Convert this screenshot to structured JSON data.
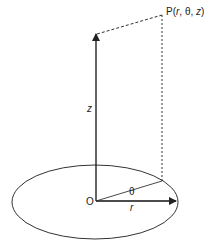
{
  "diagram": {
    "point_label": "P(r, θ, z)",
    "point_parts": {
      "p": "P(",
      "r": "r",
      "sep1": ", θ, ",
      "z": "z",
      "close": ")"
    },
    "axis_z_label": "z",
    "origin_label": "O",
    "radius_label": "r",
    "angle_label": "θ",
    "colors": {
      "line": "#222222",
      "background": "#ffffff"
    }
  }
}
